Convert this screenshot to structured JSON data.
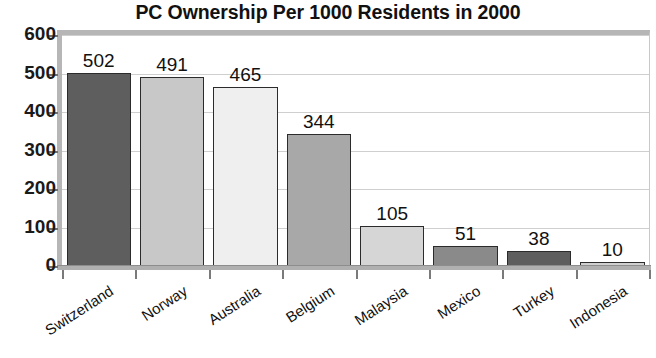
{
  "chart_data": {
    "type": "bar",
    "title": "PC Ownership Per 1000 Residents in 2000",
    "xlabel": "",
    "ylabel": "",
    "ylim": [
      0,
      600
    ],
    "yticks": [
      0,
      100,
      200,
      300,
      400,
      500,
      600
    ],
    "ytick_labels": [
      "0",
      "100",
      "200",
      "300",
      "400",
      "500",
      "600"
    ],
    "grid": true,
    "legend": "none",
    "categories": [
      "Switzerland",
      "Norway",
      "Australia",
      "Belgium",
      "Malaysia",
      "Mexico",
      "Turkey",
      "Indonesia"
    ],
    "values": [
      502,
      491,
      465,
      344,
      105,
      51,
      38,
      10
    ],
    "value_labels": [
      "502",
      "491",
      "465",
      "344",
      "105",
      "51",
      "38",
      "10"
    ],
    "bar_colors": [
      "#5e5e5e",
      "#c8c8c8",
      "#efefef",
      "#a8a8a8",
      "#d6d6d6",
      "#8a8a8a",
      "#5e5e5e",
      "#d0d0d0"
    ],
    "bar_edge_color": "#2b2b2b",
    "gridline_color": "#cfcfcf",
    "axis_color": "#b0b0b0",
    "frame_bevel_color": "#b6b6b6",
    "background_color": "#ffffff",
    "text_color": "#111111"
  }
}
